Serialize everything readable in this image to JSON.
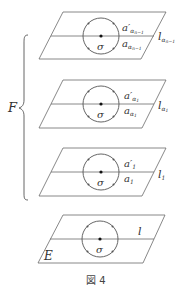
{
  "figure": {
    "caption": "図 4",
    "family_label": "F",
    "base_plane_label": "E"
  },
  "planes": [
    {
      "name": "plane-alpha-n-1",
      "line_label": "l",
      "line_sub": "α",
      "line_subsub": "n−1",
      "upper_arc": "a′",
      "lower_arc": "a",
      "arc_sub": "α",
      "arc_subsub": "n−1",
      "center_label": "σ"
    },
    {
      "name": "plane-alpha-1",
      "line_label": "l",
      "line_sub": "α",
      "line_subsub": "1",
      "upper_arc": "a′",
      "lower_arc": "a",
      "arc_sub": "α",
      "arc_subsub": "1",
      "center_label": "σ"
    },
    {
      "name": "plane-1",
      "line_label": "l",
      "line_sub": "1",
      "upper_arc": "a′",
      "lower_arc": "a",
      "arc_sub": "1",
      "center_label": "σ"
    },
    {
      "name": "plane-base",
      "line_label": "l",
      "center_label": "σ"
    }
  ]
}
